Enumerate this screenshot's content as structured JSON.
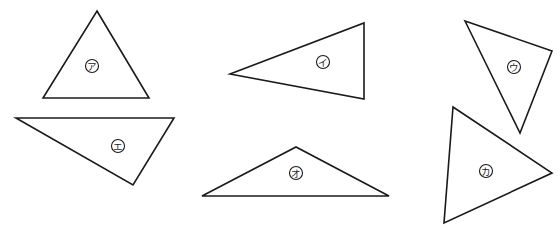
{
  "diagram": {
    "type": "geometry-figure",
    "stroke_color": "#1a1a1a",
    "background": "#ffffff",
    "triangles": [
      {
        "id": "a",
        "label": "ア",
        "points": "97,11 149,98 43,98",
        "label_pos": [
          92,
          66
        ]
      },
      {
        "id": "i",
        "label": "イ",
        "points": "230,74 364,23 364,99",
        "label_pos": [
          323,
          62
        ]
      },
      {
        "id": "u",
        "label": "ウ",
        "points": "465,21 552,51 520,133",
        "label_pos": [
          514,
          67
        ]
      },
      {
        "id": "e",
        "label": "エ",
        "points": "16,118 174,118 133,185",
        "label_pos": [
          118,
          146
        ]
      },
      {
        "id": "o",
        "label": "オ",
        "points": "202,196 296,147 389,196",
        "label_pos": [
          296,
          173
        ]
      },
      {
        "id": "ka",
        "label": "カ",
        "points": "453,107 552,173 444,223",
        "label_pos": [
          486,
          171
        ]
      }
    ]
  }
}
